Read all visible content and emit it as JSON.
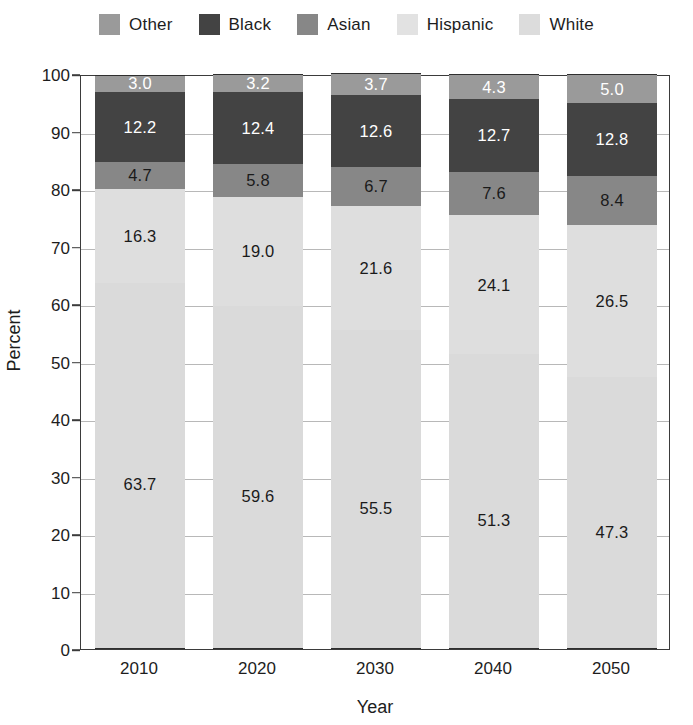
{
  "chart_data": {
    "type": "bar",
    "subtype": "stacked-bar-100",
    "title": "",
    "xlabel": "Year",
    "ylabel": "Percent",
    "categories": [
      "2010",
      "2020",
      "2030",
      "2040",
      "2050"
    ],
    "ylim": [
      0,
      100
    ],
    "yticks": [
      0,
      10,
      20,
      30,
      40,
      50,
      60,
      70,
      80,
      90,
      100
    ],
    "ytick_labels": [
      "0",
      "10",
      "20",
      "30",
      "40",
      "50",
      "60",
      "70",
      "80",
      "90",
      "100"
    ],
    "grid": true,
    "legend_position": "top",
    "stack_order_top_to_bottom": [
      "Other",
      "Black",
      "Asian",
      "Hispanic",
      "White"
    ],
    "series": [
      {
        "name": "Other",
        "color": "#9a9a9a",
        "label_color": "#ffffff",
        "values": [
          3.0,
          3.2,
          3.7,
          4.3,
          5.0
        ],
        "labels": [
          "3.0",
          "3.2",
          "3.7",
          "4.3",
          "5.0"
        ]
      },
      {
        "name": "Black",
        "color": "#434343",
        "label_color": "#ffffff",
        "values": [
          12.2,
          12.4,
          12.6,
          12.7,
          12.8
        ],
        "labels": [
          "12.2",
          "12.4",
          "12.6",
          "12.7",
          "12.8"
        ]
      },
      {
        "name": "Asian",
        "color": "#878787",
        "label_color": "#1a1a1a",
        "values": [
          4.7,
          5.8,
          6.7,
          7.6,
          8.4
        ],
        "labels": [
          "4.7",
          "5.8",
          "6.7",
          "7.6",
          "8.4"
        ]
      },
      {
        "name": "Hispanic",
        "color": "#dedede",
        "label_color": "#1a1a1a",
        "values": [
          16.3,
          19.0,
          21.6,
          24.1,
          26.5
        ],
        "labels": [
          "16.3",
          "19.0",
          "21.6",
          "24.1",
          "26.5"
        ]
      },
      {
        "name": "White",
        "color": "#dadada",
        "label_color": "#1a1a1a",
        "values": [
          63.7,
          59.6,
          55.5,
          51.3,
          47.3
        ],
        "labels": [
          "63.7",
          "59.6",
          "55.5",
          "51.3",
          "47.3"
        ]
      }
    ]
  },
  "legend": {
    "entries": [
      {
        "label": "Other",
        "color": "#9a9a9a"
      },
      {
        "label": "Black",
        "color": "#434343"
      },
      {
        "label": "Asian",
        "color": "#878787"
      },
      {
        "label": "Hispanic",
        "color": "#e2e2e2"
      },
      {
        "label": "White",
        "color": "#dcdcdc"
      }
    ]
  },
  "axes": {
    "y_title": "Percent",
    "x_title": "Year"
  }
}
